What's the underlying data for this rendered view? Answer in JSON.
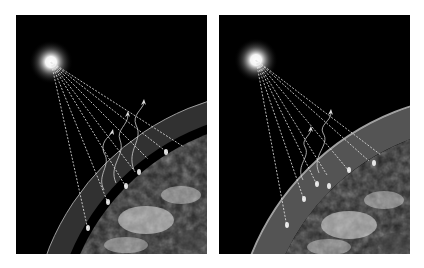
{
  "figure": {
    "background": "#ffffff",
    "panels": [
      {
        "id": "left",
        "description": "Sun radiating rays toward Earth with a thin atmosphere layer; several rays reflect back to space as wavy infrared arrows",
        "sun": {
          "cx": 35,
          "cy": 47
        },
        "atmosphere": {
          "thickness": "thin",
          "color": "#9a9a9a"
        },
        "incoming_rays": 7,
        "escaping_wavy_arrows": 3
      },
      {
        "id": "right",
        "description": "Sun radiating rays toward Earth with a thicker atmosphere layer; fewer wavy infrared arrows escape to space",
        "sun": {
          "cx": 37,
          "cy": 45
        },
        "atmosphere": {
          "thickness": "thick",
          "color": "#a8a8a8"
        },
        "incoming_rays": 7,
        "escaping_wavy_arrows": 2
      }
    ]
  }
}
